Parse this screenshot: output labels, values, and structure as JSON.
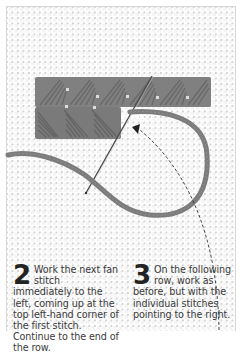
{
  "figure": {
    "colors": {
      "canvas": "#f4f4f4",
      "canvas_grid": "#ffffff",
      "yarn": "#7a7a7a",
      "yarn_dark": "#5e5e5e",
      "needle": "#555555",
      "arrow": "#333333"
    }
  },
  "steps": [
    {
      "number": "2",
      "text": "Work the next fan stitch immediately to the left, coming up at the top left-hand corner of the first stitch. Continue to the end of the row."
    },
    {
      "number": "3",
      "text": "On the following row, work as before, but with the individual stitches pointing to the right."
    }
  ]
}
